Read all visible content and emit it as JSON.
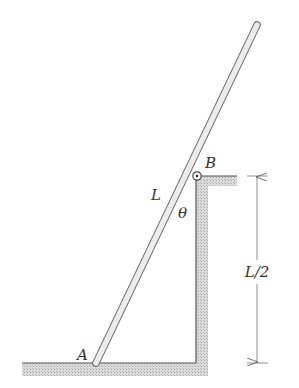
{
  "diagram": {
    "type": "mechanics-figure",
    "labels": {
      "point_a": "A",
      "point_b": "B",
      "rod_length": "L",
      "angle": "θ",
      "height_dimension": "L/2"
    },
    "colors": {
      "line": "#555555",
      "hatch": "#bdbdbd",
      "rod_fill": "#e6e6e6",
      "label": "#333333"
    },
    "geometry": {
      "floor_y": 363,
      "floor_x_start": 22,
      "wall_x": 196,
      "ledge_y": 176,
      "ledge_x_end": 237,
      "pin": {
        "x": 197,
        "y": 176,
        "r": 4
      },
      "rod": {
        "x1": 96,
        "y1": 363,
        "x2": 257,
        "y2": 25,
        "width": 7
      },
      "dimension_x": 257
    }
  }
}
